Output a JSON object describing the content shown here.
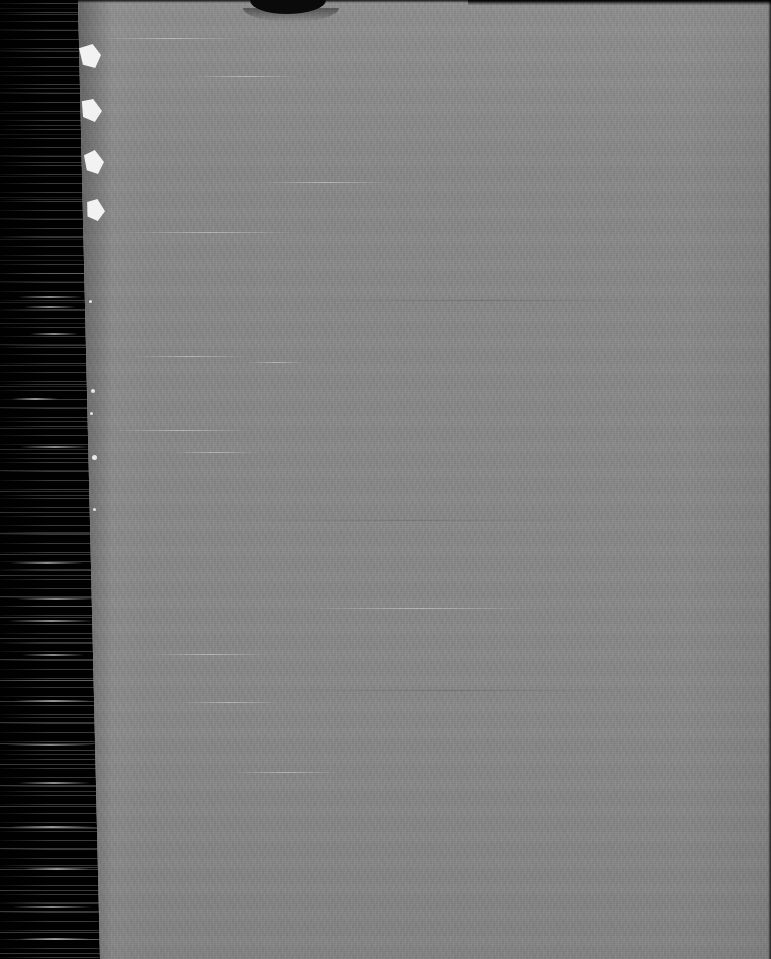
{
  "document": {
    "kind": "scanned-page-image",
    "page_type": "blank",
    "orientation": "portrait",
    "width_px": 771,
    "height_px": 959,
    "visible_text": "",
    "caption": "Blank scanned page"
  },
  "colors": {
    "page_gray": "#888888",
    "gutter_black": "#010101",
    "fragment_white": "#f2f2f2",
    "streak_gray": "#b4b4b4",
    "notch_dark": "#0a0a0a"
  },
  "regions": {
    "gutter": {
      "name": "scanner-gutter",
      "left_px": 0,
      "width_px": 102,
      "description": "black binding gutter with horizontal scan streaks"
    },
    "page": {
      "name": "paper-surface",
      "left_px": 78,
      "right_px": 771,
      "description": "uniform gray paper with fine grain and faint horizontal banding"
    }
  },
  "artifacts": {
    "top_notch": {
      "name": "torn-top-edge-notch",
      "left_px": 172,
      "width_px": 76,
      "depth_px": 14
    },
    "edge_fragments": [
      {
        "name": "paper-fragment-1",
        "top_px": 44,
        "left_px": 79
      },
      {
        "name": "paper-fragment-2",
        "top_px": 99,
        "left_px": 81
      },
      {
        "name": "paper-fragment-3",
        "top_px": 150,
        "left_px": 84
      },
      {
        "name": "paper-fragment-4",
        "top_px": 199,
        "left_px": 86
      }
    ],
    "edge_specks": [
      {
        "top_px": 300,
        "left_px": 89,
        "size_px": 3
      },
      {
        "top_px": 389,
        "left_px": 91,
        "size_px": 4
      },
      {
        "top_px": 412,
        "left_px": 90,
        "size_px": 3
      },
      {
        "top_px": 455,
        "left_px": 92,
        "size_px": 5
      },
      {
        "top_px": 508,
        "left_px": 93,
        "size_px": 3
      }
    ],
    "gutter_streaks": [
      {
        "top_px": 296,
        "left_px": 18,
        "width_px": 64
      },
      {
        "top_px": 306,
        "left_px": 24,
        "width_px": 52
      },
      {
        "top_px": 333,
        "left_px": 30,
        "width_px": 48
      },
      {
        "top_px": 398,
        "left_px": 12,
        "width_px": 46
      },
      {
        "top_px": 446,
        "left_px": 20,
        "width_px": 70
      },
      {
        "top_px": 562,
        "left_px": 10,
        "width_px": 74
      },
      {
        "top_px": 598,
        "left_px": 16,
        "width_px": 80
      },
      {
        "top_px": 620,
        "left_px": 8,
        "width_px": 86
      },
      {
        "top_px": 654,
        "left_px": 22,
        "width_px": 62
      },
      {
        "top_px": 700,
        "left_px": 14,
        "width_px": 78
      },
      {
        "top_px": 744,
        "left_px": 6,
        "width_px": 88
      },
      {
        "top_px": 782,
        "left_px": 18,
        "width_px": 72
      },
      {
        "top_px": 826,
        "left_px": 10,
        "width_px": 84
      },
      {
        "top_px": 868,
        "left_px": 24,
        "width_px": 66
      },
      {
        "top_px": 906,
        "left_px": 12,
        "width_px": 80
      },
      {
        "top_px": 938,
        "left_px": 20,
        "width_px": 70
      }
    ],
    "page_scratches": [
      {
        "top_px": 38,
        "left_px": 96,
        "width_px": 150,
        "dark": false
      },
      {
        "top_px": 76,
        "left_px": 190,
        "width_px": 110,
        "dark": false
      },
      {
        "top_px": 182,
        "left_px": 260,
        "width_px": 130,
        "dark": false
      },
      {
        "top_px": 232,
        "left_px": 120,
        "width_px": 180,
        "dark": false
      },
      {
        "top_px": 356,
        "left_px": 130,
        "width_px": 120,
        "dark": false
      },
      {
        "top_px": 362,
        "left_px": 246,
        "width_px": 60,
        "dark": false
      },
      {
        "top_px": 430,
        "left_px": 112,
        "width_px": 140,
        "dark": false
      },
      {
        "top_px": 452,
        "left_px": 170,
        "width_px": 90,
        "dark": false
      },
      {
        "top_px": 608,
        "left_px": 300,
        "width_px": 240,
        "dark": false
      },
      {
        "top_px": 654,
        "left_px": 150,
        "width_px": 120,
        "dark": false
      },
      {
        "top_px": 702,
        "left_px": 180,
        "width_px": 100,
        "dark": false
      },
      {
        "top_px": 772,
        "left_px": 230,
        "width_px": 110,
        "dark": false
      },
      {
        "top_px": 300,
        "left_px": 300,
        "width_px": 360,
        "dark": true
      },
      {
        "top_px": 520,
        "left_px": 200,
        "width_px": 420,
        "dark": true
      },
      {
        "top_px": 690,
        "left_px": 260,
        "width_px": 380,
        "dark": true
      }
    ]
  }
}
